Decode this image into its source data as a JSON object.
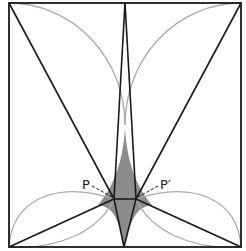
{
  "diagram": {
    "title": "",
    "labels": {
      "p": "P",
      "p_prime": "P′"
    },
    "colors": {
      "stroke": "#1a1a1a",
      "arc": "#aaaaaa",
      "fill": "#8c8c8c",
      "background": "#ffffff"
    },
    "points": {
      "square_top_left": [
        9,
        3
      ],
      "square_top_right": [
        241,
        3
      ],
      "square_bottom_left": [
        9,
        247
      ],
      "square_bottom_right": [
        241,
        247
      ],
      "top_apex": [
        125,
        3
      ],
      "bottom_apex": [
        124,
        247
      ],
      "P": [
        114,
        199
      ],
      "P_prime": [
        136,
        199
      ]
    }
  }
}
